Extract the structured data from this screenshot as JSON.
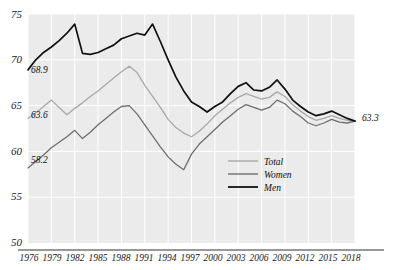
{
  "chart_data": {
    "type": "line",
    "title": "",
    "xlabel": "",
    "ylabel": "",
    "xlim": [
      1976,
      2018
    ],
    "ylim": [
      50,
      75
    ],
    "grid": true,
    "legend_position": "inside-bottom-right",
    "y_ticks": [
      "75",
      "70",
      "65",
      "60",
      "55",
      "50"
    ],
    "x_ticks": [
      "1976",
      "1979",
      "1982",
      "1985",
      "1988",
      "1991",
      "1994",
      "1997",
      "2000",
      "2003",
      "2006",
      "2009",
      "2012",
      "2015",
      "2018"
    ],
    "x": [
      1976,
      1977,
      1978,
      1979,
      1980,
      1981,
      1982,
      1983,
      1984,
      1985,
      1986,
      1987,
      1988,
      1989,
      1990,
      1991,
      1992,
      1993,
      1994,
      1995,
      1996,
      1997,
      1998,
      1999,
      2000,
      2001,
      2002,
      2003,
      2004,
      2005,
      2006,
      2007,
      2008,
      2009,
      2010,
      2011,
      2012,
      2013,
      2014,
      2015,
      2016,
      2017,
      2018
    ],
    "series": [
      {
        "name": "Total",
        "color": "#a8a8a8",
        "start_value": 63.6,
        "end_value": 63.3,
        "values": [
          63.6,
          64.2,
          64.9,
          65.6,
          64.8,
          64.0,
          64.7,
          65.3,
          66.0,
          66.6,
          67.3,
          68.0,
          68.7,
          69.3,
          68.6,
          67.2,
          66.0,
          64.8,
          63.5,
          62.6,
          62.0,
          61.6,
          62.2,
          63.0,
          63.9,
          64.6,
          65.3,
          65.9,
          66.3,
          66.0,
          65.7,
          65.9,
          66.5,
          66.0,
          65.1,
          64.4,
          63.8,
          63.4,
          63.6,
          63.9,
          63.6,
          63.4,
          63.3
        ]
      },
      {
        "name": "Women",
        "color": "#6e6e6e",
        "start_value": 58.2,
        "end_value": 63.3,
        "values": [
          58.2,
          58.9,
          59.6,
          60.4,
          61.0,
          61.6,
          62.3,
          61.4,
          62.1,
          62.9,
          63.6,
          64.3,
          64.9,
          65.0,
          64.1,
          62.9,
          61.7,
          60.5,
          59.4,
          58.6,
          58.0,
          59.7,
          60.8,
          61.6,
          62.4,
          63.2,
          63.9,
          64.6,
          65.1,
          64.8,
          64.5,
          64.8,
          65.6,
          65.2,
          64.4,
          63.8,
          63.1,
          62.8,
          63.1,
          63.5,
          63.2,
          63.1,
          63.3
        ]
      },
      {
        "name": "Men",
        "color": "#111111",
        "start_value": 68.9,
        "end_value": 63.3,
        "values": [
          68.9,
          70.0,
          70.8,
          71.4,
          72.1,
          72.9,
          73.9,
          70.7,
          70.6,
          70.8,
          71.2,
          71.6,
          72.3,
          72.6,
          72.9,
          72.7,
          73.9,
          72.0,
          70.0,
          68.1,
          66.6,
          65.4,
          64.9,
          64.3,
          64.9,
          65.4,
          66.3,
          67.1,
          67.5,
          66.7,
          66.6,
          67.0,
          67.8,
          66.8,
          65.6,
          64.9,
          64.3,
          63.9,
          64.1,
          64.4,
          64.0,
          63.6,
          63.3
        ]
      }
    ],
    "annotations": [
      {
        "label": "68.9",
        "series": "Men",
        "x": 1976,
        "position": "start"
      },
      {
        "label": "63.6",
        "series": "Total",
        "x": 1976,
        "position": "start"
      },
      {
        "label": "58.2",
        "series": "Women",
        "x": 1976,
        "position": "start"
      },
      {
        "label": "63.3",
        "series": "all",
        "x": 2018,
        "position": "end"
      }
    ],
    "legend": [
      {
        "label": "Total",
        "color": "#a8a8a8"
      },
      {
        "label": "Women",
        "color": "#6e6e6e"
      },
      {
        "label": "Men",
        "color": "#111111"
      }
    ]
  },
  "style": {
    "plot_background": "#ebebeb",
    "gridline_color": "#ffffff",
    "axis_color": "#333333",
    "text_color": "#1a1a1a"
  }
}
